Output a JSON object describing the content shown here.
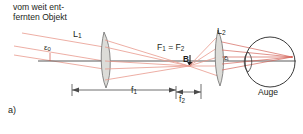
{
  "figure": {
    "panel_label": "a)",
    "object_caption_line1": "vom weit ent-",
    "object_caption_line2": "fernten Objekt",
    "lens1_label": "L",
    "lens1_sub": "1",
    "lens2_label": "L",
    "lens2_sub": "2",
    "angle_in_label": "ε",
    "angle_in_sub": "0",
    "angle_out_label": "ε",
    "focus_label_f1": "F",
    "focus_sub_1": "1",
    "focus_eq": " = ",
    "focus_label_f2": "F",
    "focus_sub_2": "2",
    "image_point_label": "B",
    "focal_len1_label": "f",
    "focal_len1_sub": "1",
    "focal_len2_label": "f",
    "focal_len2_sub": "2",
    "eye_label": "Auge",
    "colors": {
      "ray": "#e8998d",
      "ray_strong": "#d4645a",
      "axis": "#5a5a5a",
      "lens_fill": "#dcdcd8",
      "lens_stroke": "#6f6f6f",
      "eye_stroke": "#3a3a3a",
      "dimension": "#4a4a4a",
      "text": "#231f20"
    }
  }
}
